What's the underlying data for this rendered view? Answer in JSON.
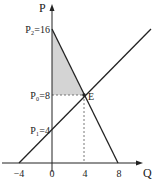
{
  "diagram": {
    "type": "supply-demand",
    "axes": {
      "y_label": "P",
      "x_label": "Q"
    },
    "y_labels": {
      "p2": "P₂=16",
      "p0": "P₀=8",
      "p1": "P₁=4"
    },
    "x_ticks": {
      "neg4": "−4",
      "zero": "0",
      "four": "4",
      "eight": "8"
    },
    "equilibrium_label": "E",
    "colors": {
      "line": "#222222",
      "shade": "#d4d4d4",
      "dash": "#555555"
    },
    "lines": {
      "demand": {
        "points": [
          [
            0,
            16
          ],
          [
            8,
            0
          ]
        ]
      },
      "supply": {
        "points": [
          [
            -4,
            0
          ],
          [
            12,
            16
          ]
        ]
      }
    },
    "equilibrium": {
      "Q": 4,
      "P": 8
    },
    "shaded_region": "consumer surplus triangle between P=8 and P=16"
  }
}
